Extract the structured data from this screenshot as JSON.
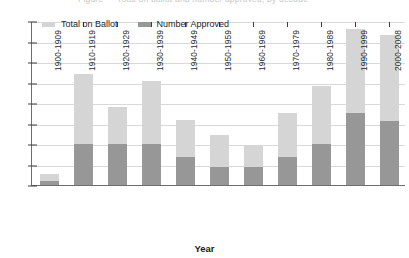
{
  "chart_data": {
    "type": "bar",
    "stacked": true,
    "title": "",
    "xlabel": "Year",
    "ylabel": "",
    "ylim": [
      0,
      400
    ],
    "ytick_step": 50,
    "yticks": [
      400,
      350,
      300,
      250,
      200,
      150,
      100,
      50,
      0
    ],
    "grid": true,
    "legend_position": "top-left",
    "categories": [
      "1900-1909",
      "1910-1919",
      "1920-1929",
      "1930-1939",
      "1940-1949",
      "1950-1959",
      "1960-1969",
      "1970-1979",
      "1980-1989",
      "1990-1999",
      "2000-2008"
    ],
    "series": [
      {
        "name": "Total on Ballot",
        "color": "#d5d5d5",
        "values": [
          28,
          270,
          190,
          253,
          158,
          122,
          98,
          175,
          242,
          380,
          367
        ]
      },
      {
        "name": "Number Approved",
        "color": "#979797",
        "values": [
          10,
          100,
          100,
          100,
          68,
          45,
          45,
          68,
          100,
          175,
          155
        ]
      }
    ]
  },
  "legend": {
    "items": [
      {
        "label": "Total on Ballot",
        "swatch": "total"
      },
      {
        "label": "Number Approved",
        "swatch": "approved"
      }
    ]
  },
  "axis": {
    "x_title": "Year"
  },
  "title_strip": {
    "text": "Figure — Total on ballot and number approved, by decade"
  }
}
